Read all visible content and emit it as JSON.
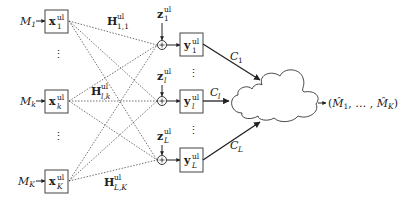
{
  "diagram": {
    "inputs": [
      {
        "message": "M",
        "message_sub": "1",
        "signal": "x",
        "signal_sup": "ul",
        "signal_sub": "1"
      },
      {
        "message": "M",
        "message_sub": "k",
        "signal": "x",
        "signal_sup": "ul",
        "signal_sub": "k"
      },
      {
        "message": "M",
        "message_sub": "K",
        "signal": "x",
        "signal_sup": "ul",
        "signal_sub": "K"
      }
    ],
    "channels": [
      {
        "symbol": "H",
        "sup": "ul",
        "sub": "1,1"
      },
      {
        "symbol": "H",
        "sup": "ul",
        "sub": "l,k"
      },
      {
        "symbol": "H",
        "sup": "ul",
        "sub": "L,K"
      }
    ],
    "noises": [
      {
        "symbol": "z",
        "sup": "ul",
        "sub": "1"
      },
      {
        "symbol": "z",
        "sup": "ul",
        "sub": "l"
      },
      {
        "symbol": "z",
        "sup": "ul",
        "sub": "L"
      }
    ],
    "outputs": [
      {
        "symbol": "y",
        "sup": "ul",
        "sub": "1"
      },
      {
        "symbol": "y",
        "sup": "ul",
        "sub": "l"
      },
      {
        "symbol": "y",
        "sup": "ul",
        "sub": "L"
      }
    ],
    "fronthaul": [
      {
        "symbol": "C",
        "sub": "1"
      },
      {
        "symbol": "C",
        "sub": "l"
      },
      {
        "symbol": "C",
        "sub": "L"
      }
    ],
    "plus_symbol": "+",
    "vdots": "⋮",
    "decoded": {
      "open": "(",
      "first": "M̂",
      "first_sub": "1",
      "sep": ", … , ",
      "last": "M̂",
      "last_sub": "K",
      "close": ")"
    }
  }
}
